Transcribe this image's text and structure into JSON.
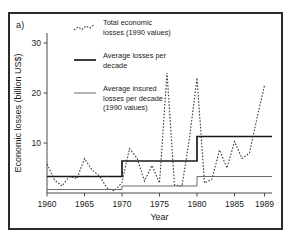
{
  "figure": {
    "panel_label": "a)",
    "background_color": "#ffffff",
    "frame_color": "#2b2b2b"
  },
  "legend": {
    "position": "top-center-inside",
    "entries": [
      {
        "key": "total-economic-losses",
        "line1": "Total economic",
        "line2": "losses (1990 values)",
        "line3": "",
        "style": "dashed",
        "color": "#3a3a3a"
      },
      {
        "key": "average-losses-per-decade",
        "line1": "Average losses per",
        "line2": "decade",
        "line3": "",
        "style": "thick-solid",
        "color": "#1a1a1a"
      },
      {
        "key": "average-insured-losses-per-decade",
        "line1": "Average insured",
        "line2": "losses per decade",
        "line3": "(1990 values)",
        "style": "thin-solid",
        "color": "#5a5a5a"
      }
    ]
  },
  "chart_data": {
    "type": "line",
    "title": "",
    "xlabel": "Year",
    "ylabel": "Economic losses (billion US$)",
    "xlim": [
      1960,
      1990
    ],
    "ylim": [
      0,
      32
    ],
    "xticks": [
      1960,
      1965,
      1970,
      1975,
      1980,
      1985,
      1989
    ],
    "yticks": [
      10,
      20,
      30
    ],
    "grid": false,
    "x": [
      1960,
      1961,
      1962,
      1963,
      1964,
      1965,
      1966,
      1967,
      1968,
      1969,
      1970,
      1971,
      1972,
      1973,
      1974,
      1975,
      1976,
      1977,
      1978,
      1979,
      1980,
      1981,
      1982,
      1983,
      1984,
      1985,
      1986,
      1987,
      1988,
      1989
    ],
    "series": [
      {
        "name": "Total economic losses (1990 values)",
        "style": "dashed",
        "values": [
          5.8,
          2.6,
          1.4,
          3.3,
          2.9,
          6.9,
          4.6,
          3.4,
          1.0,
          0.4,
          2.1,
          8.9,
          7.0,
          2.4,
          5.5,
          2.0,
          24.0,
          1.6,
          1.4,
          11.0,
          23.0,
          2.0,
          2.8,
          8.6,
          5.0,
          10.3,
          6.9,
          8.0,
          15.0,
          21.5
        ]
      },
      {
        "name": "Average losses per decade",
        "style": "thick-solid",
        "steps": [
          {
            "from": 1960,
            "to": 1970,
            "value": 3.3
          },
          {
            "from": 1970,
            "to": 1980,
            "value": 6.4
          },
          {
            "from": 1980,
            "to": 1990,
            "value": 11.3
          }
        ]
      },
      {
        "name": "Average insured losses per decade (1990 values)",
        "style": "thin-solid",
        "steps": [
          {
            "from": 1960,
            "to": 1970,
            "value": 0.7
          },
          {
            "from": 1970,
            "to": 1980,
            "value": 1.4
          },
          {
            "from": 1980,
            "to": 1990,
            "value": 3.3
          }
        ]
      }
    ]
  }
}
